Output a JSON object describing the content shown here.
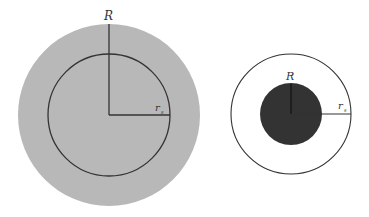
{
  "colors": {
    "background": "#ffffff",
    "left_fill": "#b8b8b8",
    "right_core_fill": "#333333",
    "stroke": "#333333"
  },
  "left_diagram": {
    "outer_label": "R",
    "inner_label": "r",
    "inner_subscript": "s",
    "description": "Large gray disc of radius R with an inscribed circle of radius r_s"
  },
  "right_diagram": {
    "inner_label": "R",
    "outer_label": "r",
    "outer_subscript": "s",
    "description": "Small dark disc of radius R inside an empty circle of radius r_s"
  }
}
